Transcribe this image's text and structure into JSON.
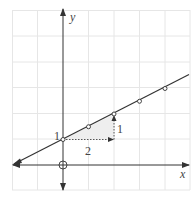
{
  "diagram": {
    "type": "coordinate-graph",
    "axes": {
      "x_label": "x",
      "y_label": "y",
      "origin_marker": "circle-crosshair"
    },
    "grid": {
      "x_range": [
        -2,
        5
      ],
      "y_range": [
        -1,
        6
      ],
      "unit_px": 25.5
    },
    "line": {
      "equation": "y = x/2 + 1",
      "slope": "1/2",
      "y_intercept": 1
    },
    "points": [
      {
        "x": 0,
        "y": 1
      },
      {
        "x": 1,
        "y": 1.5
      },
      {
        "x": 2,
        "y": 2
      },
      {
        "x": 3,
        "y": 2.5
      },
      {
        "x": 4,
        "y": 3
      }
    ],
    "labels": {
      "intercept": "1",
      "run": "2",
      "rise": "1"
    },
    "colors": {
      "line": "#333333",
      "grid": "#e4e4e4",
      "triangle": "#eeeeee"
    }
  }
}
